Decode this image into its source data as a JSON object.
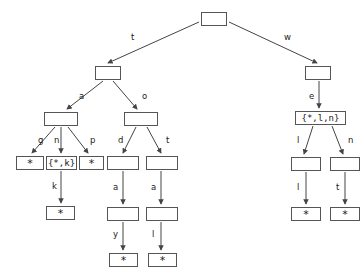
{
  "diagram": {
    "stroke_color": "#555555",
    "text_color": "#1a1a1a",
    "background_color": "#ffffff",
    "nodes": [
      {
        "id": "root",
        "label": "",
        "kind": "empty",
        "x": 201,
        "y": 12,
        "w": 26,
        "h": 14
      },
      {
        "id": "n_t",
        "label": "",
        "kind": "empty",
        "x": 95,
        "y": 66,
        "w": 26,
        "h": 14
      },
      {
        "id": "n_w",
        "label": "",
        "kind": "empty",
        "x": 305,
        "y": 66,
        "w": 26,
        "h": 14
      },
      {
        "id": "n_a",
        "label": "",
        "kind": "empty",
        "x": 44,
        "y": 112,
        "w": 34,
        "h": 14
      },
      {
        "id": "n_o",
        "label": "",
        "kind": "empty",
        "x": 124,
        "y": 112,
        "w": 34,
        "h": 14
      },
      {
        "id": "n_e",
        "label": "{*,l,n}",
        "kind": "setlabel",
        "x": 295,
        "y": 111,
        "w": 51,
        "h": 14
      },
      {
        "id": "n_g",
        "label": "*",
        "kind": "star",
        "x": 16,
        "y": 156,
        "w": 28,
        "h": 14
      },
      {
        "id": "n_n",
        "label": "{*,k}",
        "kind": "setlabel",
        "x": 46,
        "y": 156,
        "w": 31,
        "h": 14
      },
      {
        "id": "n_p",
        "label": "*",
        "kind": "star",
        "x": 79,
        "y": 156,
        "w": 25,
        "h": 14
      },
      {
        "id": "n_d",
        "label": "",
        "kind": "empty",
        "x": 107,
        "y": 156,
        "w": 32,
        "h": 14
      },
      {
        "id": "n_t2",
        "label": "",
        "kind": "empty",
        "x": 146,
        "y": 156,
        "w": 32,
        "h": 14
      },
      {
        "id": "n_l",
        "label": "",
        "kind": "empty",
        "x": 291,
        "y": 157,
        "w": 30,
        "h": 14
      },
      {
        "id": "n_n2",
        "label": "",
        "kind": "empty",
        "x": 330,
        "y": 157,
        "w": 30,
        "h": 14
      },
      {
        "id": "n_k",
        "label": "*",
        "kind": "star",
        "x": 46,
        "y": 206,
        "w": 29,
        "h": 14
      },
      {
        "id": "n_a2",
        "label": "",
        "kind": "empty",
        "x": 107,
        "y": 207,
        "w": 32,
        "h": 14
      },
      {
        "id": "n_a3",
        "label": "",
        "kind": "empty",
        "x": 146,
        "y": 207,
        "w": 32,
        "h": 14
      },
      {
        "id": "n_l2",
        "label": "*",
        "kind": "star",
        "x": 291,
        "y": 207,
        "w": 30,
        "h": 14
      },
      {
        "id": "n_t3",
        "label": "*",
        "kind": "star",
        "x": 330,
        "y": 207,
        "w": 30,
        "h": 14
      },
      {
        "id": "n_y",
        "label": "*",
        "kind": "star",
        "x": 109,
        "y": 253,
        "w": 29,
        "h": 14
      },
      {
        "id": "n_l3",
        "label": "*",
        "kind": "star",
        "x": 148,
        "y": 253,
        "w": 29,
        "h": 14
      }
    ],
    "edges": [
      {
        "from": "root",
        "to": "n_t",
        "label": "t",
        "x1": 199,
        "y1": 22,
        "x2": 108,
        "y2": 63,
        "lx": 131,
        "ly": 33
      },
      {
        "from": "root",
        "to": "n_w",
        "label": "w",
        "x1": 229,
        "y1": 22,
        "x2": 317,
        "y2": 63,
        "lx": 284,
        "ly": 33
      },
      {
        "from": "n_t",
        "to": "n_a",
        "label": "a",
        "x1": 103,
        "y1": 81,
        "x2": 67,
        "y2": 109,
        "lx": 79,
        "ly": 92
      },
      {
        "from": "n_t",
        "to": "n_o",
        "label": "o",
        "x1": 113,
        "y1": 81,
        "x2": 137,
        "y2": 109,
        "lx": 142,
        "ly": 92
      },
      {
        "from": "n_w",
        "to": "n_e",
        "label": "e",
        "x1": 319,
        "y1": 81,
        "x2": 319,
        "y2": 108,
        "lx": 309,
        "ly": 92
      },
      {
        "from": "n_a",
        "to": "n_g",
        "label": "g",
        "x1": 55,
        "y1": 127,
        "x2": 32,
        "y2": 153,
        "lx": 38,
        "ly": 136
      },
      {
        "from": "n_a",
        "to": "n_n",
        "label": "n",
        "x1": 61,
        "y1": 127,
        "x2": 61,
        "y2": 153,
        "lx": 54,
        "ly": 136
      },
      {
        "from": "n_a",
        "to": "n_p",
        "label": "p",
        "x1": 68,
        "y1": 127,
        "x2": 88,
        "y2": 153,
        "lx": 90,
        "ly": 136
      },
      {
        "from": "n_o",
        "to": "n_d",
        "label": "d",
        "x1": 136,
        "y1": 127,
        "x2": 123,
        "y2": 153,
        "lx": 118,
        "ly": 136
      },
      {
        "from": "n_o",
        "to": "n_t2",
        "label": "t",
        "x1": 147,
        "y1": 127,
        "x2": 161,
        "y2": 153,
        "lx": 166,
        "ly": 136
      },
      {
        "from": "n_e",
        "to": "n_l",
        "label": "l",
        "x1": 313,
        "y1": 126,
        "x2": 304,
        "y2": 154,
        "lx": 297,
        "ly": 136
      },
      {
        "from": "n_e",
        "to": "n_n2",
        "label": "n",
        "x1": 332,
        "y1": 126,
        "x2": 343,
        "y2": 154,
        "lx": 348,
        "ly": 136
      },
      {
        "from": "n_n",
        "to": "n_k",
        "label": "k",
        "x1": 61,
        "y1": 171,
        "x2": 61,
        "y2": 203,
        "lx": 52,
        "ly": 182
      },
      {
        "from": "n_d",
        "to": "n_a2",
        "label": "a",
        "x1": 123,
        "y1": 171,
        "x2": 123,
        "y2": 204,
        "lx": 113,
        "ly": 183
      },
      {
        "from": "n_t2",
        "to": "n_a3",
        "label": "a",
        "x1": 161,
        "y1": 171,
        "x2": 161,
        "y2": 204,
        "lx": 151,
        "ly": 183
      },
      {
        "from": "n_l",
        "to": "n_l2",
        "label": "l",
        "x1": 306,
        "y1": 172,
        "x2": 306,
        "y2": 204,
        "lx": 297,
        "ly": 183
      },
      {
        "from": "n_n2",
        "to": "n_t3",
        "label": "t",
        "x1": 345,
        "y1": 172,
        "x2": 345,
        "y2": 204,
        "lx": 336,
        "ly": 183
      },
      {
        "from": "n_a2",
        "to": "n_y",
        "label": "y",
        "x1": 123,
        "y1": 222,
        "x2": 123,
        "y2": 250,
        "lx": 113,
        "ly": 230
      },
      {
        "from": "n_a3",
        "to": "n_l3",
        "label": "l",
        "x1": 161,
        "y1": 222,
        "x2": 161,
        "y2": 250,
        "lx": 152,
        "ly": 230
      }
    ]
  }
}
